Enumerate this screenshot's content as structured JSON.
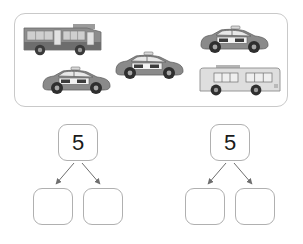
{
  "worksheet": {
    "title": "Number bonds of 5 with vehicles",
    "panel": {
      "name": "vehicle-picture-box",
      "count": 5,
      "vehicles": [
        {
          "type": "bus",
          "label": "bus",
          "body_color": "#8d8d8d",
          "x": 22,
          "y": 23,
          "w": 82,
          "h": 33
        },
        {
          "type": "taxi",
          "label": "taxi",
          "body_color": "#8a8a8a",
          "x": 40,
          "y": 63,
          "w": 70,
          "h": 32
        },
        {
          "type": "taxi",
          "label": "taxi",
          "body_color": "#8a8a8a",
          "x": 113,
          "y": 48,
          "w": 72,
          "h": 33
        },
        {
          "type": "taxi",
          "label": "taxi",
          "body_color": "#8a8a8a",
          "x": 198,
          "y": 22,
          "w": 74,
          "h": 33
        },
        {
          "type": "bus",
          "label": "bus",
          "body_color": "#d6d6d6",
          "x": 197,
          "y": 64,
          "w": 82,
          "h": 33
        }
      ],
      "taxi_sign_text": "TAXI"
    },
    "bonds": [
      {
        "id": "bond-left",
        "whole": "5",
        "parts": [
          "",
          ""
        ]
      },
      {
        "id": "bond-right",
        "whole": "5",
        "parts": [
          "",
          ""
        ]
      }
    ]
  },
  "colors": {
    "panel_border": "#c9c9c9",
    "node_border": "#b0b0b0",
    "arrow": "#6e6e6e",
    "text": "#1a1a1a",
    "taxi_body": "#8a8a8a",
    "bus_body_dark": "#8d8d8d",
    "bus_body_light": "#d6d6d6",
    "wheel": "#3a3a3a",
    "background": "#ffffff"
  }
}
